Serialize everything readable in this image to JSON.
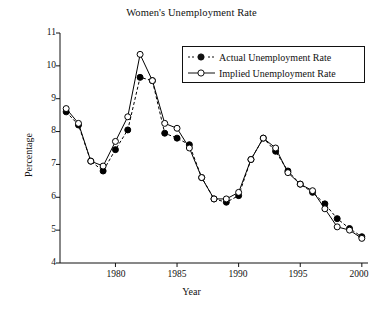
{
  "chart_data": {
    "type": "line",
    "title": "Women's Unemployment Rate",
    "xlabel": "Year",
    "ylabel": "Percentage",
    "xlim": [
      1975.5,
      2000.5
    ],
    "ylim": [
      4,
      11
    ],
    "xticks": [
      1980,
      1985,
      1990,
      1995,
      2000
    ],
    "xtick_labels": [
      "1980",
      "1985",
      "1990",
      "1995",
      "2000"
    ],
    "yticks": [
      4,
      5,
      6,
      7,
      8,
      9,
      10,
      11
    ],
    "ytick_labels": [
      "4",
      "5",
      "6",
      "7",
      "8",
      "9",
      "10",
      "11"
    ],
    "grid": false,
    "legend_position": "top-right",
    "x": [
      1976,
      1977,
      1978,
      1979,
      1980,
      1981,
      1982,
      1983,
      1984,
      1985,
      1986,
      1987,
      1988,
      1989,
      1990,
      1991,
      1992,
      1993,
      1994,
      1995,
      1996,
      1997,
      1998,
      1999,
      2000
    ],
    "series": [
      {
        "name": "Actual Unemployment Rate",
        "marker": "filled-circle",
        "linestyle": "dashed",
        "color": "#000000",
        "values": [
          8.6,
          8.2,
          7.1,
          6.8,
          7.45,
          8.05,
          9.65,
          9.55,
          7.95,
          7.8,
          7.6,
          6.6,
          5.95,
          5.85,
          6.05,
          7.15,
          7.8,
          7.4,
          6.8,
          6.4,
          6.15,
          5.8,
          5.35,
          5.05,
          4.8
        ]
      },
      {
        "name": "Implied Unemployment Rate",
        "marker": "open-circle",
        "linestyle": "solid",
        "color": "#000000",
        "values": [
          8.7,
          8.25,
          7.1,
          6.95,
          7.7,
          8.45,
          10.35,
          9.55,
          8.25,
          8.1,
          7.5,
          6.6,
          5.95,
          5.95,
          6.15,
          7.15,
          7.8,
          7.5,
          6.75,
          6.4,
          6.2,
          5.65,
          5.1,
          5.0,
          4.75
        ]
      }
    ]
  },
  "legend": {
    "entries": [
      {
        "label": "Actual Unemployment Rate",
        "marker": "filled-circle",
        "linestyle": "dashed"
      },
      {
        "label": "Implied Unemployment Rate",
        "marker": "open-circle",
        "linestyle": "solid"
      }
    ]
  }
}
